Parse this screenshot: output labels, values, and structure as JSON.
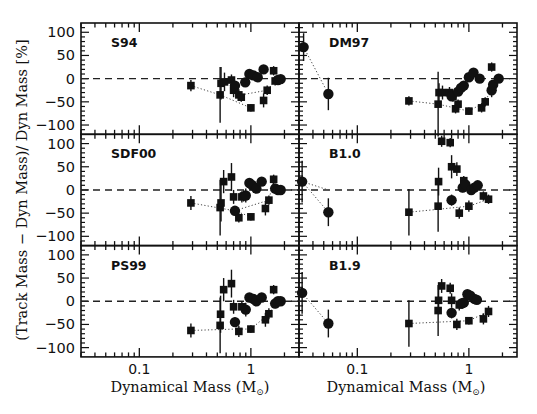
{
  "chart_data": {
    "type": "scatter",
    "title": "",
    "xlabel": "Dynamical Mass (M⊙)",
    "ylabel": "(Track Mass − Dyn Mass)/ Dyn Mass [%]",
    "xscale": "log",
    "xlim": [
      0.03,
      2.7
    ],
    "ylim": [
      -120,
      120
    ],
    "xticks": [
      {
        "value": 0.1,
        "label": "0.1"
      },
      {
        "value": 1,
        "label": "1"
      }
    ],
    "yticks": [
      {
        "value": 100,
        "label": "100"
      },
      {
        "value": 50,
        "label": "50"
      },
      {
        "value": 0,
        "label": "0"
      },
      {
        "value": -50,
        "label": "−50"
      },
      {
        "value": -100,
        "label": "−100"
      }
    ],
    "reference_line": {
      "y": 0,
      "style": "dashed"
    },
    "layout": {
      "rows": 3,
      "cols": 2,
      "shared_x": true,
      "shared_y": true
    },
    "panels": [
      {
        "label": "S94",
        "row": 0,
        "col": 0,
        "squares": [
          {
            "x": 0.29,
            "y": -15,
            "err": 12
          },
          {
            "x": 0.53,
            "y": -35,
            "err": 60
          },
          {
            "x": 0.54,
            "y": -10,
            "err": 35
          },
          {
            "x": 0.58,
            "y": -7,
            "err": 20
          },
          {
            "x": 0.67,
            "y": -3,
            "err": 12
          },
          {
            "x": 0.7,
            "y": -25,
            "err": 15
          },
          {
            "x": 0.72,
            "y": -20,
            "err": 12
          },
          {
            "x": 0.78,
            "y": -35,
            "err": 12
          },
          {
            "x": 0.82,
            "y": -40,
            "err": 10
          },
          {
            "x": 1.0,
            "y": -63,
            "err": 8
          },
          {
            "x": 1.3,
            "y": -47,
            "err": 15
          },
          {
            "x": 1.4,
            "y": -25,
            "err": 10
          },
          {
            "x": 1.6,
            "y": 17,
            "err": 10
          },
          {
            "x": 1.65,
            "y": -5,
            "err": 10
          }
        ],
        "circles": [
          {
            "x": 0.72,
            "y": -15,
            "err": 10
          },
          {
            "x": 0.89,
            "y": -8,
            "err": 10
          },
          {
            "x": 0.97,
            "y": 10,
            "err": 8
          },
          {
            "x": 1.05,
            "y": 7,
            "err": 8
          },
          {
            "x": 1.15,
            "y": 3,
            "err": 6
          },
          {
            "x": 1.3,
            "y": 20,
            "err": 0
          },
          {
            "x": 1.75,
            "y": -3,
            "err": 0
          },
          {
            "x": 1.85,
            "y": -1,
            "err": 0
          }
        ],
        "dotted_tracks": [
          [
            [
              0.29,
              -15
            ],
            [
              0.53,
              -35
            ],
            [
              1.0,
              -63
            ]
          ],
          [
            [
              0.82,
              -35
            ],
            [
              1.4,
              -25
            ],
            [
              1.65,
              -5
            ]
          ]
        ]
      },
      {
        "label": "DM97",
        "row": 0,
        "col": 1,
        "squares": [
          {
            "x": 0.29,
            "y": -48,
            "err": 10
          },
          {
            "x": 0.53,
            "y": -55,
            "err": 70
          },
          {
            "x": 0.54,
            "y": -30,
            "err": 20
          },
          {
            "x": 0.58,
            "y": -30,
            "err": 15
          },
          {
            "x": 0.67,
            "y": -30,
            "err": 12
          },
          {
            "x": 0.72,
            "y": -38,
            "err": 12
          },
          {
            "x": 0.76,
            "y": -65,
            "err": 10
          },
          {
            "x": 0.8,
            "y": -55,
            "err": 10
          },
          {
            "x": 1.0,
            "y": -70,
            "err": 8
          },
          {
            "x": 1.3,
            "y": -63,
            "err": 10
          },
          {
            "x": 1.4,
            "y": -50,
            "err": 10
          },
          {
            "x": 1.6,
            "y": 25,
            "err": 10
          }
        ],
        "circles": [
          {
            "x": 0.033,
            "y": 68,
            "err": 30
          },
          {
            "x": 0.055,
            "y": -33,
            "err": 35
          },
          {
            "x": 0.7,
            "y": -38,
            "err": 8
          },
          {
            "x": 0.8,
            "y": -28,
            "err": 8
          },
          {
            "x": 0.85,
            "y": -20,
            "err": 8
          },
          {
            "x": 0.9,
            "y": -15,
            "err": 8
          },
          {
            "x": 1.0,
            "y": 3,
            "err": 6
          },
          {
            "x": 1.1,
            "y": 13,
            "err": 6
          },
          {
            "x": 1.25,
            "y": 0,
            "err": 6
          },
          {
            "x": 1.6,
            "y": -25,
            "err": 15
          },
          {
            "x": 1.65,
            "y": -13,
            "err": 10
          },
          {
            "x": 1.85,
            "y": 0,
            "err": 0
          }
        ],
        "dotted_tracks": [
          [
            [
              0.033,
              68
            ],
            [
              0.055,
              -33
            ]
          ],
          [
            [
              0.29,
              -48
            ],
            [
              0.53,
              -55
            ],
            [
              1.0,
              -70
            ]
          ],
          [
            [
              1.0,
              -70
            ],
            [
              1.4,
              -50
            ],
            [
              1.65,
              -13
            ]
          ]
        ]
      },
      {
        "label": "SDF00",
        "row": 1,
        "col": 0,
        "squares": [
          {
            "x": 0.29,
            "y": -28,
            "err": 15
          },
          {
            "x": 0.53,
            "y": -38,
            "err": 60
          },
          {
            "x": 0.54,
            "y": -28,
            "err": 40
          },
          {
            "x": 0.57,
            "y": 18,
            "err": 25
          },
          {
            "x": 0.67,
            "y": 28,
            "err": 30
          },
          {
            "x": 0.7,
            "y": -15,
            "err": 15
          },
          {
            "x": 0.78,
            "y": -60,
            "err": 10
          },
          {
            "x": 0.83,
            "y": -15,
            "err": 12
          },
          {
            "x": 0.86,
            "y": -13,
            "err": 12
          },
          {
            "x": 1.0,
            "y": -58,
            "err": 8
          },
          {
            "x": 1.35,
            "y": -40,
            "err": 15
          },
          {
            "x": 1.45,
            "y": -22,
            "err": 10
          },
          {
            "x": 1.6,
            "y": 23,
            "err": 10
          }
        ],
        "circles": [
          {
            "x": 0.72,
            "y": -45,
            "err": 10
          },
          {
            "x": 0.9,
            "y": -12,
            "err": 15
          },
          {
            "x": 0.97,
            "y": 15,
            "err": 8
          },
          {
            "x": 1.03,
            "y": 10,
            "err": 8
          },
          {
            "x": 1.12,
            "y": 3,
            "err": 6
          },
          {
            "x": 1.25,
            "y": 18,
            "err": 0
          },
          {
            "x": 1.65,
            "y": 3,
            "err": 10
          },
          {
            "x": 1.75,
            "y": 0,
            "err": 0
          },
          {
            "x": 1.85,
            "y": 0,
            "err": 0
          }
        ],
        "dotted_tracks": [
          [
            [
              0.29,
              -28
            ],
            [
              0.72,
              -45
            ],
            [
              1.0,
              -58
            ]
          ],
          [
            [
              0.83,
              -40
            ],
            [
              1.45,
              -22
            ],
            [
              1.6,
              23
            ]
          ]
        ]
      },
      {
        "label": "B1.0",
        "row": 1,
        "col": 1,
        "squares": [
          {
            "x": 0.29,
            "y": -48,
            "err": 50
          },
          {
            "x": 0.53,
            "y": -35,
            "err": 55
          },
          {
            "x": 0.535,
            "y": 18,
            "err": 30
          },
          {
            "x": 0.57,
            "y": 105,
            "err": 12
          },
          {
            "x": 0.68,
            "y": 102,
            "err": 10
          },
          {
            "x": 0.7,
            "y": 50,
            "err": 25
          },
          {
            "x": 0.78,
            "y": 45,
            "err": 15
          },
          {
            "x": 0.82,
            "y": -50,
            "err": 12
          },
          {
            "x": 0.9,
            "y": 20,
            "err": 10
          },
          {
            "x": 1.0,
            "y": -35,
            "err": 12
          },
          {
            "x": 1.35,
            "y": -13,
            "err": 10
          },
          {
            "x": 1.5,
            "y": -20,
            "err": 10
          }
        ],
        "circles": [
          {
            "x": 0.032,
            "y": 18,
            "err": 45
          },
          {
            "x": 0.055,
            "y": -48,
            "err": 30
          },
          {
            "x": 0.7,
            "y": -22,
            "err": 12
          },
          {
            "x": 0.88,
            "y": 5,
            "err": 10
          },
          {
            "x": 0.93,
            "y": 12,
            "err": 8
          },
          {
            "x": 1.05,
            "y": 0,
            "err": 8
          },
          {
            "x": 1.12,
            "y": 5,
            "err": 8
          },
          {
            "x": 1.2,
            "y": 10,
            "err": 6
          }
        ],
        "dotted_tracks": [
          [
            [
              0.032,
              18
            ],
            [
              0.055,
              -48
            ]
          ],
          [
            [
              0.29,
              -48
            ],
            [
              1.0,
              -35
            ],
            [
              1.5,
              -20
            ]
          ],
          [
            [
              0.032,
              18
            ],
            [
              0.055,
              0
            ]
          ]
        ]
      },
      {
        "label": "PS99",
        "row": 2,
        "col": 0,
        "squares": [
          {
            "x": 0.29,
            "y": -63,
            "err": 15
          },
          {
            "x": 0.53,
            "y": -52,
            "err": 60
          },
          {
            "x": 0.535,
            "y": -28,
            "err": 40
          },
          {
            "x": 0.57,
            "y": 25,
            "err": 25
          },
          {
            "x": 0.67,
            "y": 38,
            "err": 30
          },
          {
            "x": 0.7,
            "y": -12,
            "err": 15
          },
          {
            "x": 0.78,
            "y": -65,
            "err": 12
          },
          {
            "x": 0.83,
            "y": -12,
            "err": 12
          },
          {
            "x": 1.0,
            "y": -60,
            "err": 8
          },
          {
            "x": 1.35,
            "y": -40,
            "err": 15
          },
          {
            "x": 1.45,
            "y": -27,
            "err": 12
          },
          {
            "x": 1.6,
            "y": 25,
            "err": 10
          }
        ],
        "circles": [
          {
            "x": 0.72,
            "y": -45,
            "err": 10
          },
          {
            "x": 0.9,
            "y": -18,
            "err": 15
          },
          {
            "x": 0.97,
            "y": 8,
            "err": 8
          },
          {
            "x": 1.05,
            "y": 5,
            "err": 8
          },
          {
            "x": 1.12,
            "y": 0,
            "err": 6
          },
          {
            "x": 1.25,
            "y": 8,
            "err": 0
          },
          {
            "x": 1.65,
            "y": -5,
            "err": 10
          },
          {
            "x": 1.75,
            "y": 0,
            "err": 0
          },
          {
            "x": 1.85,
            "y": 0,
            "err": 0
          }
        ],
        "dotted_tracks": [
          [
            [
              0.29,
              -63
            ],
            [
              0.72,
              -60
            ],
            [
              1.0,
              -60
            ]
          ],
          [
            [
              1.0,
              -60
            ],
            [
              1.45,
              -27
            ],
            [
              1.65,
              -5
            ]
          ]
        ]
      },
      {
        "label": "B1.9",
        "row": 2,
        "col": 1,
        "squares": [
          {
            "x": 0.29,
            "y": -48,
            "err": 50
          },
          {
            "x": 0.53,
            "y": -20,
            "err": 55
          },
          {
            "x": 0.535,
            "y": 2,
            "err": 30
          },
          {
            "x": 0.57,
            "y": 33,
            "err": 15
          },
          {
            "x": 0.68,
            "y": 28,
            "err": 12
          },
          {
            "x": 0.7,
            "y": 2,
            "err": 15
          },
          {
            "x": 0.78,
            "y": -50,
            "err": 12
          },
          {
            "x": 0.82,
            "y": -8,
            "err": 12
          },
          {
            "x": 1.0,
            "y": -42,
            "err": 8
          },
          {
            "x": 1.35,
            "y": -38,
            "err": 12
          },
          {
            "x": 1.5,
            "y": -22,
            "err": 12
          }
        ],
        "circles": [
          {
            "x": 0.032,
            "y": 18,
            "err": 45
          },
          {
            "x": 0.055,
            "y": -48,
            "err": 30
          },
          {
            "x": 0.7,
            "y": -25,
            "err": 12
          },
          {
            "x": 0.86,
            "y": -5,
            "err": 10
          },
          {
            "x": 0.9,
            "y": -3,
            "err": 8
          },
          {
            "x": 0.97,
            "y": 15,
            "err": 8
          },
          {
            "x": 1.03,
            "y": 12,
            "err": 8
          },
          {
            "x": 1.12,
            "y": 5,
            "err": 6
          },
          {
            "x": 1.18,
            "y": 3,
            "err": 6
          }
        ],
        "dotted_tracks": [
          [
            [
              0.032,
              18
            ],
            [
              0.055,
              -48
            ]
          ],
          [
            [
              0.29,
              -48
            ],
            [
              1.0,
              -42
            ],
            [
              1.5,
              -22
            ]
          ]
        ]
      }
    ]
  },
  "axes": {
    "xlabel_main": "Dynamical Mass (M",
    "xlabel_sub": "⊙",
    "xlabel_close": ")",
    "ylabel": "(Track Mass − Dyn Mass)/ Dyn Mass [%]"
  }
}
